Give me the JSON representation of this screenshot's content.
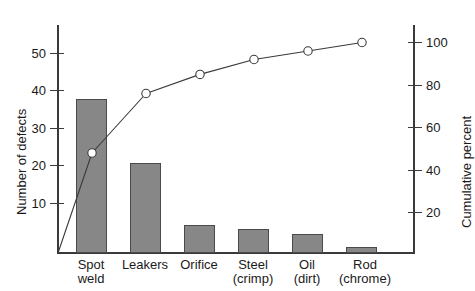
{
  "chart_data": {
    "type": "bar",
    "title": "",
    "subtitle": "",
    "categories": [
      "Spot weld",
      "Leakers",
      "Orifice",
      "Steel (crimp)",
      "Oil (dirt)",
      "Rod (chrome)"
    ],
    "category_lines": [
      [
        "Spot",
        "weld"
      ],
      [
        "Leakers",
        ""
      ],
      [
        "Orifice",
        ""
      ],
      [
        "Steel",
        "(crimp)"
      ],
      [
        "Oil",
        "(dirt)"
      ],
      [
        "Rod",
        "(chrome)"
      ]
    ],
    "series": [
      {
        "name": "Number of defects",
        "type": "bar",
        "values": [
          41,
          24,
          7.5,
          6.5,
          5,
          1.5
        ],
        "axis": "left"
      },
      {
        "name": "Cumulative percent",
        "type": "line",
        "values": [
          48,
          76,
          85,
          92,
          96,
          100
        ],
        "axis": "right",
        "marker": "open-circle"
      }
    ],
    "xlabel": "",
    "ylabel": "Number of defects",
    "y2label": "Cumulative percent",
    "ylim": [
      0,
      57
    ],
    "y2lim": [
      0,
      105
    ],
    "yticks": [
      10,
      20,
      30,
      40,
      50
    ],
    "y2ticks": [
      20,
      40,
      60,
      80,
      100
    ],
    "grid": false,
    "legend": "none",
    "bar_color": "#878787",
    "line_color": "#3a3a3a",
    "axis_color": "#3a3a3a"
  },
  "axes": {
    "left": {
      "title": "Number of defects",
      "ticks": [
        {
          "label": "50"
        },
        {
          "label": "40"
        },
        {
          "label": "30"
        },
        {
          "label": "20"
        },
        {
          "label": "10"
        }
      ]
    },
    "right": {
      "title": "Cumulative percent",
      "ticks": [
        {
          "label": "100"
        },
        {
          "label": "80"
        },
        {
          "label": "60"
        },
        {
          "label": "40"
        },
        {
          "label": "20"
        }
      ]
    }
  }
}
